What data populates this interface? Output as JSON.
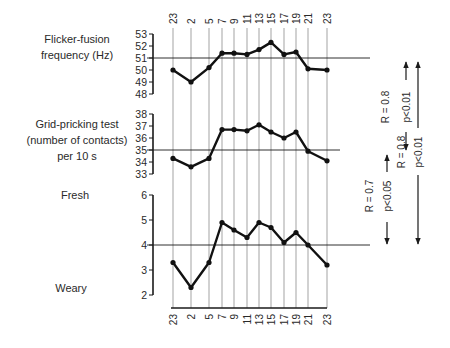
{
  "chart_data": {
    "type": "line",
    "x": [
      "23",
      "2",
      "5",
      "7",
      "9",
      "11",
      "13",
      "15",
      "17",
      "19",
      "21",
      "23"
    ],
    "x_positions": [
      173,
      191,
      209,
      222,
      234,
      247,
      259,
      271,
      284,
      296,
      308,
      327
    ],
    "xlabel": "",
    "grid": "vertical lines at each time point",
    "panels": [
      {
        "id": "flicker",
        "title_lines": [
          "Flicker-fusion",
          "frequency (Hz)"
        ],
        "ylabel": "Flicker-fusion frequency (Hz)",
        "yticks": [
          "53",
          "52",
          "51",
          "50",
          "49",
          "48"
        ],
        "ylim": [
          48,
          53
        ],
        "reference_line": 51,
        "values": [
          50.0,
          49.0,
          50.2,
          51.4,
          51.4,
          51.3,
          51.7,
          52.3,
          51.3,
          51.5,
          50.1,
          50.0
        ]
      },
      {
        "id": "grid-pricking",
        "title_lines": [
          "Grid-pricking test",
          "(number of contacts)",
          "per 10 s"
        ],
        "ylabel": "Grid-pricking test (number of contacts) per 10 s",
        "yticks": [
          "38",
          "37",
          "36",
          "35",
          "34",
          "33"
        ],
        "ylim": [
          33,
          38
        ],
        "reference_line": 35,
        "values": [
          34.3,
          33.6,
          34.3,
          36.7,
          36.7,
          36.6,
          37.1,
          36.5,
          36.0,
          36.5,
          34.9,
          34.1
        ]
      },
      {
        "id": "fresh-weary",
        "title_top": "Fresh",
        "title_bottom": "Weary",
        "ylabel": "Fresh / Weary rating",
        "yticks": [
          "6",
          "5",
          "4",
          "3",
          "2"
        ],
        "ylim": [
          2,
          6
        ],
        "reference_line": 4,
        "values": [
          3.3,
          2.3,
          3.3,
          4.9,
          4.6,
          4.3,
          4.9,
          4.7,
          4.1,
          4.5,
          4.0,
          3.2
        ]
      }
    ],
    "annotations": [
      {
        "between": [
          "flicker",
          "grid-pricking"
        ],
        "r": "R = 0.8",
        "p": "p<0.01"
      },
      {
        "between": [
          "grid-pricking",
          "fresh-weary"
        ],
        "r": "R = 0.7",
        "p": "p<0.05"
      },
      {
        "between": [
          "flicker",
          "fresh-weary"
        ],
        "r": "R = 0.8",
        "p": "p<0.01"
      }
    ]
  },
  "labels": {
    "flicker_1": "Flicker-fusion",
    "flicker_2": "frequency (Hz)",
    "grid_1": "Grid-pricking test",
    "grid_2": "(number of contacts)",
    "grid_3": "per 10 s",
    "fresh": "Fresh",
    "weary": "Weary",
    "ann1_r": "R = 0.8",
    "ann1_p": "p<0.01",
    "ann2_r": "R = 0.7",
    "ann2_p": "p<0.05",
    "ann3_r": "R = 0.8",
    "ann3_p": "p<0.01"
  },
  "colors": {
    "ink": "#1a1a1a",
    "grid": "#555555",
    "background": "#ffffff"
  }
}
